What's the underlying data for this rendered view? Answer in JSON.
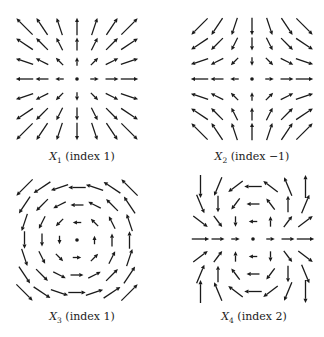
{
  "figure": {
    "background": "#ffffff",
    "arrow_color": "#1a1a1a",
    "grid_size": 7,
    "grid_spacing_px": 17.5,
    "panels": [
      {
        "id": "X1",
        "var": "X",
        "sub": "1",
        "label_rest": " (index 1)",
        "index": 1,
        "field": "radial_source",
        "formula": "(x, y)",
        "center": [
          77,
          79
        ],
        "caption_pos": [
          82,
          158
        ]
      },
      {
        "id": "X2",
        "var": "X",
        "sub": "2",
        "label_rest": " (index −1)",
        "index": -1,
        "field": "saddle",
        "formula": "(x, -y)",
        "center": [
          252,
          79
        ],
        "caption_pos": [
          252,
          158
        ]
      },
      {
        "id": "X3",
        "var": "X",
        "sub": "3",
        "label_rest": " (index 1)",
        "index": 1,
        "field": "rotation",
        "formula": "(-y, x)",
        "center": [
          77,
          240
        ],
        "caption_pos": [
          82,
          318
        ]
      },
      {
        "id": "X4",
        "var": "X",
        "sub": "4",
        "label_rest": " (index 2)",
        "index": 2,
        "field": "dipole",
        "formula": "(x^2 - y^2, 2xy)",
        "center": [
          253,
          239
        ],
        "caption_pos": [
          254,
          318
        ]
      }
    ]
  }
}
